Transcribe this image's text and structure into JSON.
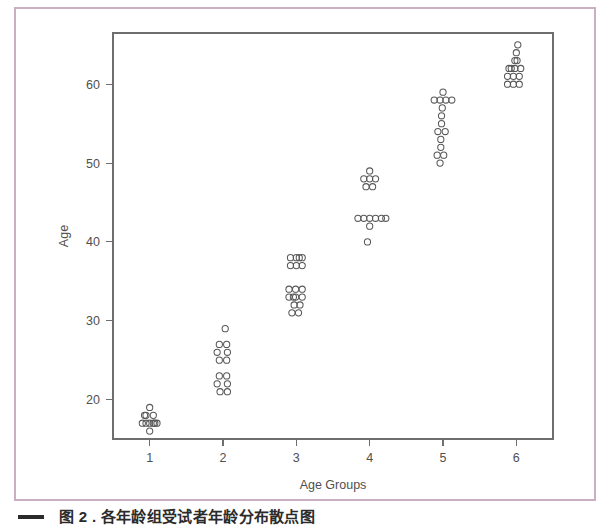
{
  "figure": {
    "border_color": "#c9aec4",
    "background_color": "#ffffff",
    "axis_color": "#6e6e6e",
    "point_color": "#585858"
  },
  "caption": {
    "rule": "",
    "text": "图 2  . 各年龄组受试者年龄分布散点图"
  },
  "chart_data": {
    "type": "scatter",
    "title": "",
    "subtitle": "",
    "xlabel": "Age Groups",
    "ylabel": "Age",
    "grid": false,
    "legend": "none",
    "xlim": [
      0.5,
      6.5
    ],
    "ylim": [
      15.0,
      66.5
    ],
    "xticks": [
      1,
      2,
      3,
      4,
      5,
      6
    ],
    "xtick_labels": [
      "1",
      "2",
      "3",
      "4",
      "5",
      "6"
    ],
    "yticks": [
      20,
      30,
      40,
      50,
      60
    ],
    "ytick_labels": [
      "20",
      "30",
      "40",
      "50",
      "60"
    ],
    "point_marker": "open-circle",
    "jitter": "horizontal",
    "groups": [
      {
        "name": "1",
        "x": 1,
        "n": 11,
        "min": 16,
        "max": 19,
        "points": [
          {
            "x": 1.0,
            "y": 19
          },
          {
            "x": 0.95,
            "y": 18
          },
          {
            "x": 1.05,
            "y": 18
          },
          {
            "x": 0.9,
            "y": 17
          },
          {
            "x": 1.0,
            "y": 17
          },
          {
            "x": 1.1,
            "y": 17
          },
          {
            "x": 0.95,
            "y": 17
          },
          {
            "x": 1.05,
            "y": 17
          },
          {
            "x": 1.0,
            "y": 16
          },
          {
            "x": 0.93,
            "y": 18
          },
          {
            "x": 1.07,
            "y": 17
          }
        ]
      },
      {
        "name": "2",
        "x": 2,
        "n": 13,
        "min": 21,
        "max": 29,
        "points": [
          {
            "x": 2.03,
            "y": 29
          },
          {
            "x": 1.95,
            "y": 27
          },
          {
            "x": 2.05,
            "y": 27
          },
          {
            "x": 1.92,
            "y": 26
          },
          {
            "x": 2.06,
            "y": 26
          },
          {
            "x": 1.95,
            "y": 25
          },
          {
            "x": 2.05,
            "y": 25
          },
          {
            "x": 1.95,
            "y": 23
          },
          {
            "x": 2.05,
            "y": 23
          },
          {
            "x": 1.92,
            "y": 22
          },
          {
            "x": 2.06,
            "y": 22
          },
          {
            "x": 1.96,
            "y": 21
          },
          {
            "x": 2.06,
            "y": 21
          }
        ]
      },
      {
        "name": "3",
        "x": 3,
        "n": 18,
        "min": 31,
        "max": 38,
        "points": [
          {
            "x": 2.92,
            "y": 38
          },
          {
            "x": 3.0,
            "y": 38
          },
          {
            "x": 3.08,
            "y": 38
          },
          {
            "x": 2.92,
            "y": 37
          },
          {
            "x": 3.0,
            "y": 37
          },
          {
            "x": 3.08,
            "y": 37
          },
          {
            "x": 2.9,
            "y": 34
          },
          {
            "x": 2.99,
            "y": 34
          },
          {
            "x": 3.08,
            "y": 34
          },
          {
            "x": 2.9,
            "y": 33
          },
          {
            "x": 2.99,
            "y": 33
          },
          {
            "x": 3.08,
            "y": 33
          },
          {
            "x": 2.97,
            "y": 32
          },
          {
            "x": 3.05,
            "y": 32
          },
          {
            "x": 2.94,
            "y": 31
          },
          {
            "x": 3.03,
            "y": 31
          },
          {
            "x": 2.96,
            "y": 33
          },
          {
            "x": 3.04,
            "y": 38
          }
        ]
      },
      {
        "name": "4",
        "x": 4,
        "n": 14,
        "min": 40,
        "max": 49,
        "points": [
          {
            "x": 4.0,
            "y": 49
          },
          {
            "x": 3.92,
            "y": 48
          },
          {
            "x": 4.0,
            "y": 48
          },
          {
            "x": 4.08,
            "y": 48
          },
          {
            "x": 3.95,
            "y": 47
          },
          {
            "x": 4.04,
            "y": 47
          },
          {
            "x": 3.84,
            "y": 43
          },
          {
            "x": 3.92,
            "y": 43
          },
          {
            "x": 4.0,
            "y": 43
          },
          {
            "x": 4.08,
            "y": 43
          },
          {
            "x": 4.16,
            "y": 43
          },
          {
            "x": 4.22,
            "y": 43
          },
          {
            "x": 4.0,
            "y": 42
          },
          {
            "x": 3.97,
            "y": 40
          }
        ]
      },
      {
        "name": "5",
        "x": 5,
        "n": 15,
        "min": 50,
        "max": 59,
        "points": [
          {
            "x": 5.0,
            "y": 59
          },
          {
            "x": 4.88,
            "y": 58
          },
          {
            "x": 4.96,
            "y": 58
          },
          {
            "x": 5.04,
            "y": 58
          },
          {
            "x": 5.12,
            "y": 58
          },
          {
            "x": 4.98,
            "y": 56
          },
          {
            "x": 4.98,
            "y": 55
          },
          {
            "x": 4.93,
            "y": 54
          },
          {
            "x": 5.03,
            "y": 54
          },
          {
            "x": 4.97,
            "y": 53
          },
          {
            "x": 4.97,
            "y": 52
          },
          {
            "x": 4.92,
            "y": 51
          },
          {
            "x": 5.01,
            "y": 51
          },
          {
            "x": 4.96,
            "y": 50
          },
          {
            "x": 4.99,
            "y": 57
          }
        ]
      },
      {
        "name": "6",
        "x": 6,
        "n": 14,
        "min": 60,
        "max": 65,
        "points": [
          {
            "x": 6.02,
            "y": 65
          },
          {
            "x": 6.0,
            "y": 64
          },
          {
            "x": 5.98,
            "y": 63
          },
          {
            "x": 5.9,
            "y": 62
          },
          {
            "x": 5.98,
            "y": 62
          },
          {
            "x": 6.06,
            "y": 62
          },
          {
            "x": 5.88,
            "y": 61
          },
          {
            "x": 5.96,
            "y": 61
          },
          {
            "x": 6.04,
            "y": 61
          },
          {
            "x": 5.88,
            "y": 60
          },
          {
            "x": 5.96,
            "y": 60
          },
          {
            "x": 6.04,
            "y": 60
          },
          {
            "x": 6.01,
            "y": 63
          },
          {
            "x": 5.93,
            "y": 62
          }
        ]
      }
    ]
  }
}
